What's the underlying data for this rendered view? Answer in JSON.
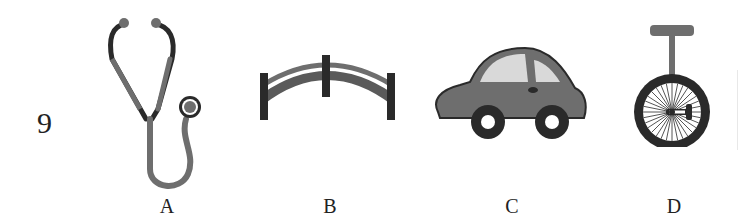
{
  "question": {
    "number": "9",
    "options": [
      {
        "label": "A",
        "icon": "stethoscope-icon"
      },
      {
        "label": "B",
        "icon": "arch-bridge-icon"
      },
      {
        "label": "C",
        "icon": "car-icon"
      },
      {
        "label": "D",
        "icon": "unicycle-icon"
      }
    ]
  },
  "colors": {
    "dark": "#2a2a2a",
    "mid_gray": "#6e6e6e",
    "light_gray": "#d9d9d9"
  }
}
